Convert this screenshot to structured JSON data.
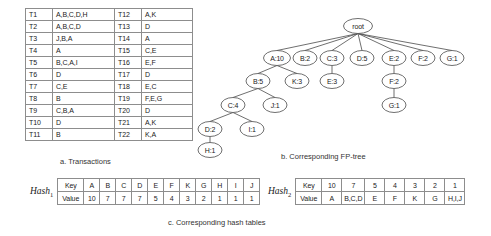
{
  "figure": {
    "captions": {
      "a": "a. Transactions",
      "b": "b. Corresponding FP-tree",
      "c": "c. Corresponding hash tables"
    }
  },
  "transactions": {
    "left_column": [
      {
        "tid": "T1",
        "items": "A,B,C,D,H"
      },
      {
        "tid": "T2",
        "items": "A,B,C,D"
      },
      {
        "tid": "T3",
        "items": "J,B,A"
      },
      {
        "tid": "T4",
        "items": "A"
      },
      {
        "tid": "T5",
        "items": "B,C,A,I"
      },
      {
        "tid": "T6",
        "items": "D"
      },
      {
        "tid": "T7",
        "items": "C,E"
      },
      {
        "tid": "T8",
        "items": "B"
      },
      {
        "tid": "T9",
        "items": "C,B,A"
      },
      {
        "tid": "T10",
        "items": "D"
      },
      {
        "tid": "T11",
        "items": "B"
      }
    ],
    "right_column": [
      {
        "tid": "T12",
        "items": "A,K"
      },
      {
        "tid": "T13",
        "items": "D"
      },
      {
        "tid": "T14",
        "items": "A"
      },
      {
        "tid": "T15",
        "items": "C,E"
      },
      {
        "tid": "T16",
        "items": "E,F"
      },
      {
        "tid": "T17",
        "items": "D"
      },
      {
        "tid": "T18",
        "items": "E,C"
      },
      {
        "tid": "T19",
        "items": "F,E,G"
      },
      {
        "tid": "T20",
        "items": "D"
      },
      {
        "tid": "T21",
        "items": "A,K"
      },
      {
        "tid": "T22",
        "items": "K,A"
      }
    ]
  },
  "fptree": {
    "root_label": "root",
    "nodes": [
      {
        "id": "root",
        "label": "root",
        "cx": 178,
        "cy": 21,
        "rx": 14.5,
        "ry": 7.5
      },
      {
        "id": "a10",
        "label": "A:10",
        "cx": 97,
        "cy": 53,
        "rx": 13.5,
        "ry": 7.5
      },
      {
        "id": "b2",
        "label": "B:2",
        "cx": 125,
        "cy": 53,
        "rx": 12,
        "ry": 7.5
      },
      {
        "id": "c3",
        "label": "C:3",
        "cx": 152,
        "cy": 53,
        "rx": 12,
        "ry": 7.5
      },
      {
        "id": "d5",
        "label": "D:5",
        "cx": 182,
        "cy": 53,
        "rx": 12,
        "ry": 7.5
      },
      {
        "id": "e2",
        "label": "E:2",
        "cx": 214,
        "cy": 53,
        "rx": 12,
        "ry": 7.5
      },
      {
        "id": "f2",
        "label": "F:2",
        "cx": 243,
        "cy": 53,
        "rx": 12,
        "ry": 7.5
      },
      {
        "id": "g1",
        "label": "G:1",
        "cx": 272,
        "cy": 53,
        "rx": 12,
        "ry": 7.5
      },
      {
        "id": "b5",
        "label": "B:5",
        "cx": 78,
        "cy": 76,
        "rx": 12,
        "ry": 7.5
      },
      {
        "id": "k3",
        "label": "K:3",
        "cx": 117,
        "cy": 76,
        "rx": 12,
        "ry": 7.5
      },
      {
        "id": "e3",
        "label": "E:3",
        "cx": 152,
        "cy": 76,
        "rx": 12,
        "ry": 7.5
      },
      {
        "id": "f2b",
        "label": "F:2",
        "cx": 214,
        "cy": 76,
        "rx": 12,
        "ry": 7.5
      },
      {
        "id": "c4",
        "label": "C:4",
        "cx": 53,
        "cy": 100,
        "rx": 12,
        "ry": 7.5
      },
      {
        "id": "j1",
        "label": "J:1",
        "cx": 95,
        "cy": 100,
        "rx": 12,
        "ry": 7.5
      },
      {
        "id": "g1b",
        "label": "G:1",
        "cx": 214,
        "cy": 100,
        "rx": 12,
        "ry": 7.5
      },
      {
        "id": "d2",
        "label": "D:2",
        "cx": 30,
        "cy": 124,
        "rx": 12,
        "ry": 7.5
      },
      {
        "id": "i1",
        "label": "I:1",
        "cx": 72,
        "cy": 124,
        "rx": 12,
        "ry": 7.5
      },
      {
        "id": "h1",
        "label": "H:1",
        "cx": 30,
        "cy": 145,
        "rx": 12,
        "ry": 7.5
      }
    ],
    "edges": [
      {
        "from": "root",
        "to": "a10"
      },
      {
        "from": "root",
        "to": "b2"
      },
      {
        "from": "root",
        "to": "c3"
      },
      {
        "from": "root",
        "to": "d5"
      },
      {
        "from": "root",
        "to": "e2"
      },
      {
        "from": "root",
        "to": "f2"
      },
      {
        "from": "root",
        "to": "g1"
      },
      {
        "from": "a10",
        "to": "b5"
      },
      {
        "from": "a10",
        "to": "k3"
      },
      {
        "from": "c3",
        "to": "e3"
      },
      {
        "from": "e2",
        "to": "f2b"
      },
      {
        "from": "b5",
        "to": "c4"
      },
      {
        "from": "b5",
        "to": "j1"
      },
      {
        "from": "f2b",
        "to": "g1b"
      },
      {
        "from": "c4",
        "to": "d2"
      },
      {
        "from": "c4",
        "to": "i1"
      },
      {
        "from": "d2",
        "to": "h1"
      }
    ]
  },
  "hash_tables": {
    "hash1": {
      "name": "Hash",
      "subscript": "1",
      "row_labels": {
        "key": "Key",
        "value": "Value"
      },
      "keys": [
        "A",
        "B",
        "C",
        "D",
        "E",
        "F",
        "K",
        "G",
        "H",
        "I",
        "J"
      ],
      "values": [
        "10",
        "7",
        "7",
        "7",
        "5",
        "4",
        "3",
        "2",
        "1",
        "1",
        "1"
      ]
    },
    "hash2": {
      "name": "Hash",
      "subscript": "2",
      "row_labels": {
        "key": "Key",
        "value": "Value"
      },
      "keys": [
        "10",
        "7",
        "5",
        "4",
        "3",
        "2",
        "1"
      ],
      "values": [
        "A",
        "B,C,D",
        "E",
        "F",
        "K",
        "G",
        "H,I,J"
      ]
    }
  }
}
